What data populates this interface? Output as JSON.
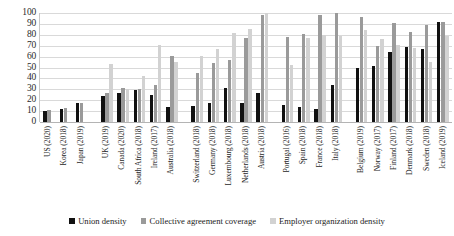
{
  "chart_data": {
    "type": "bar",
    "title": "",
    "xlabel": "",
    "ylabel": "",
    "ylim": [
      0,
      100
    ],
    "yticks": [
      100,
      90,
      80,
      70,
      60,
      50,
      40,
      30,
      20,
      10,
      0
    ],
    "grid": true,
    "legend_position": "bottom",
    "colors": {
      "union_density": "#111111",
      "collective_agreement_coverage": "#9a9a9a",
      "employer_organization_density": "#d2d2d2"
    },
    "categories": [
      "US (2020)",
      "Korea (2018)",
      "Japan (2019)",
      "UK (2019)",
      "Canada (2020)",
      "South Africa (2018)",
      "Ireland (2017)",
      "Australia (2018)",
      "Switzerland (2018)",
      "Germany (2018)",
      "Luxembourg (2018)",
      "Netherlands (2018)",
      "Austria (2018)",
      "Portugal (2016)",
      "Spain (2018)",
      "France (2018)",
      "Italy (2018)",
      "Belgium (2019)",
      "Norway (2017)",
      "Finland (2017)",
      "Denmark (2018)",
      "Sweden (2018)",
      "Iceland (2019)"
    ],
    "cluster_groups": [
      {
        "label": "",
        "categories": [
          "US (2020)",
          "Korea (2018)",
          "Japan (2019)"
        ]
      },
      {
        "label": "",
        "categories": [
          "UK (2019)",
          "Canada (2020)",
          "South Africa (2018)",
          "Ireland (2017)",
          "Australia (2018)"
        ]
      },
      {
        "label": "",
        "categories": [
          "Switzerland (2018)",
          "Germany (2018)",
          "Luxembourg (2018)",
          "Netherlands (2018)",
          "Austria (2018)"
        ]
      },
      {
        "label": "",
        "categories": [
          "Portugal (2016)",
          "Spain (2018)",
          "France (2018)",
          "Italy (2018)"
        ]
      },
      {
        "label": "",
        "categories": [
          "Belgium (2019)",
          "Norway (2017)",
          "Finland (2017)",
          "Denmark (2018)",
          "Sweden (2018)",
          "Iceland (2019)"
        ]
      }
    ],
    "series": [
      {
        "name": "Union density",
        "color": "#111111",
        "values": [
          10,
          12,
          17,
          24,
          27,
          29,
          25,
          14,
          15,
          17,
          31,
          17,
          27,
          16,
          14,
          12,
          34,
          50,
          51,
          64,
          69,
          67,
          92
        ]
      },
      {
        "name": "Collective agreement coverage",
        "color": "#9a9a9a",
        "values": [
          11,
          13,
          17,
          27,
          31,
          30,
          34,
          61,
          45,
          54,
          57,
          77,
          98,
          78,
          81,
          98,
          100,
          96,
          70,
          91,
          83,
          89,
          92
        ]
      },
      {
        "name": "Employer organization density",
        "color": "#d2d2d2",
        "values": [
          null,
          null,
          null,
          53,
          30,
          42,
          71,
          55,
          61,
          67,
          82,
          85,
          100,
          52,
          77,
          80,
          79,
          84,
          76,
          71,
          68,
          55,
          79
        ]
      }
    ],
    "legend": [
      {
        "label": "Union density",
        "swatch": "#111111"
      },
      {
        "label": "Collective agreement coverage",
        "swatch": "#9a9a9a"
      },
      {
        "label": "Employer organization density",
        "swatch": "#d2d2d2"
      }
    ]
  }
}
